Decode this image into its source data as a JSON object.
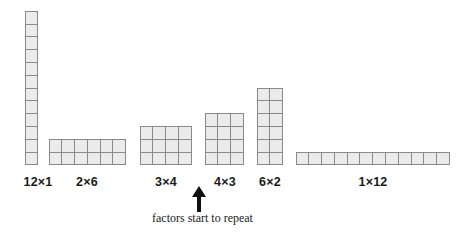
{
  "diagram": {
    "product": 12,
    "cell_size_px": 12.8,
    "baseline_y_px": 165,
    "colors": {
      "cell_fill": "#ebebeb",
      "cell_border": "#8a8a8a",
      "text": "#1a1a1a",
      "background": "#ffffff"
    },
    "arrays": [
      {
        "label": "12×1",
        "rows": 12,
        "cols": 1,
        "left_px": 25,
        "label_center_x_px": 38
      },
      {
        "label": "2×6",
        "rows": 2,
        "cols": 6,
        "left_px": 49,
        "label_center_x_px": 87
      },
      {
        "label": "3×4",
        "rows": 3,
        "cols": 4,
        "left_px": 140,
        "label_center_x_px": 166
      },
      {
        "label": "4×3",
        "rows": 4,
        "cols": 3,
        "left_px": 205,
        "label_center_x_px": 225
      },
      {
        "label": "6×2",
        "rows": 6,
        "cols": 2,
        "left_px": 257,
        "label_center_x_px": 270
      },
      {
        "label": "1×12",
        "rows": 1,
        "cols": 12,
        "left_px": 296,
        "label_center_x_px": 373
      }
    ],
    "annotation": {
      "caption": "factors start to repeat",
      "arrow": "up-arrow-icon",
      "points_at": "4×3"
    }
  }
}
